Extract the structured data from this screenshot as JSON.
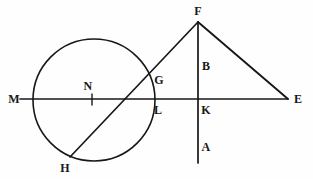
{
  "figure": {
    "width": 313,
    "height": 179,
    "background_color": "#fefefe",
    "stroke_color": "#171717"
  },
  "shapes": {
    "circle": {
      "name": "circle-N",
      "cx": 94,
      "cy": 100,
      "r": 61,
      "stroke_width": 1.6
    },
    "horizontal_line": {
      "name": "line-ME",
      "x1": 20,
      "y1": 99,
      "x2": 288,
      "y2": 99,
      "stroke_width": 1.7
    },
    "vertical_line": {
      "name": "line-FA",
      "x1": 198,
      "y1": 22,
      "x2": 198,
      "y2": 163,
      "stroke_width": 1.7
    },
    "diagonal_line": {
      "name": "line-HF",
      "x1": 70,
      "y1": 157,
      "x2": 198,
      "y2": 22,
      "stroke_width": 1.7
    },
    "triangle_side": {
      "name": "line-FE",
      "x1": 198,
      "y1": 22,
      "x2": 288,
      "y2": 99,
      "stroke_width": 1.9
    },
    "center_tick": {
      "name": "tick-N",
      "x1": 92,
      "y1": 94,
      "x2": 92,
      "y2": 105,
      "stroke_width": 1.4
    }
  },
  "labels": [
    {
      "id": "label-M",
      "text": "M",
      "x": 14,
      "y": 99
    },
    {
      "id": "label-N",
      "text": "N",
      "x": 88,
      "y": 86
    },
    {
      "id": "label-G",
      "text": "G",
      "x": 159,
      "y": 80
    },
    {
      "id": "label-L",
      "text": "L",
      "x": 158,
      "y": 110
    },
    {
      "id": "label-K",
      "text": "K",
      "x": 206,
      "y": 110
    },
    {
      "id": "label-E",
      "text": "E",
      "x": 298,
      "y": 99
    },
    {
      "id": "label-F",
      "text": "F",
      "x": 198,
      "y": 11
    },
    {
      "id": "label-B",
      "text": "B",
      "x": 206,
      "y": 66
    },
    {
      "id": "label-A",
      "text": "A",
      "x": 206,
      "y": 147
    },
    {
      "id": "label-H",
      "text": "H",
      "x": 65,
      "y": 168
    }
  ]
}
